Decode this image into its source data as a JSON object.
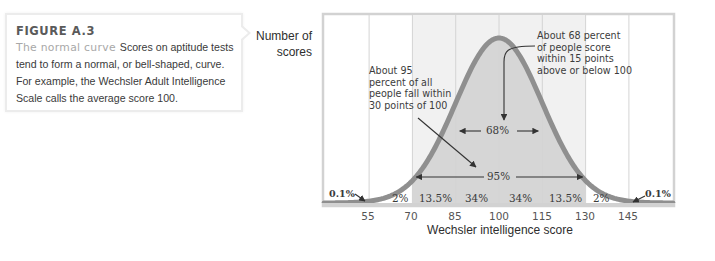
{
  "caption": {
    "figure_label": "FIGURE A.3",
    "title": "The normal curve",
    "body": "Scores on aptitude tests tend to form a normal, or bell-shaped, curve. For example, the Wechsler Adult Intelligence Scale calls the average score 100."
  },
  "annotations": {
    "note_95": [
      "About 95",
      "percent of all",
      "people fall within",
      "30 points of 100"
    ],
    "note_68": [
      "About 68 percent",
      "of people score",
      "within 15 points",
      "above or below 100"
    ],
    "label_68": "68%",
    "label_95": "95%",
    "tail_left": "0.1%",
    "tail_right": "0.1%"
  },
  "colors": {
    "curve": "#8f8f8f",
    "fill_inner": "#d6d6d6",
    "fill_outer": "#ececec",
    "gridline": "#d4d4d4",
    "frame": "#d2d2d2"
  },
  "chart_data": {
    "type": "area",
    "title": "The normal curve",
    "xlabel": "Wechsler intelligence score",
    "ylabel": "Number of scores",
    "x_ticks": [
      55,
      70,
      85,
      100,
      115,
      130,
      145
    ],
    "xlim": [
      40,
      160
    ],
    "grid": true,
    "distribution": {
      "mean": 100,
      "sd": 15
    },
    "bands": [
      {
        "range": "<55",
        "percent": "0.1%"
      },
      {
        "range": "55-70",
        "percent": "2%"
      },
      {
        "range": "70-85",
        "percent": "13.5%"
      },
      {
        "range": "85-100",
        "percent": "34%"
      },
      {
        "range": "100-115",
        "percent": "34%"
      },
      {
        "range": "115-130",
        "percent": "13.5%"
      },
      {
        "range": "130-145",
        "percent": "2%"
      },
      {
        "range": ">145",
        "percent": "0.1%"
      }
    ],
    "spans": [
      {
        "label": "68%",
        "from": 85,
        "to": 115
      },
      {
        "label": "95%",
        "from": 70,
        "to": 130
      }
    ]
  }
}
